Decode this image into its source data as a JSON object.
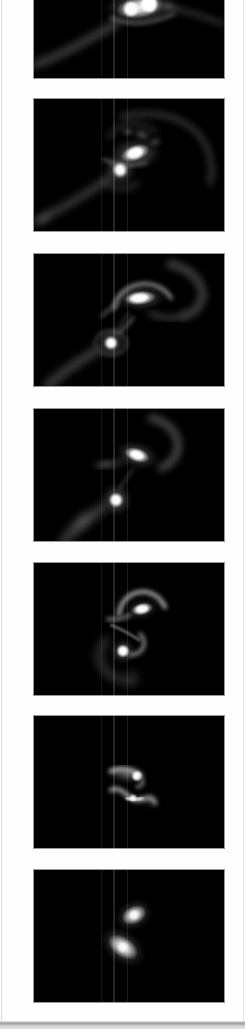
{
  "app": {
    "title": "Galaxy merger simulation filmstrip"
  },
  "colors": {
    "page_background": "#fefefe",
    "frame_background": "#000000",
    "frame_border": "#979797",
    "panel_left_border": "#dcdcdc",
    "bottom_edge": "#9e9e9e",
    "galaxy_core": "#ffffff",
    "tidal_tail": "#4a4a4a"
  },
  "frames": [
    {
      "id": "frame-1",
      "label": "Simulation frame 1 - bright merging core with long tidal tail (top cropped by scroll)"
    },
    {
      "id": "frame-2",
      "label": "Simulation frame 2 - two cores, sweeping right arc and lower-left tidal tail"
    },
    {
      "id": "frame-3",
      "label": "Simulation frame 3 - spiral core under dome arc, companion core with broad tail"
    },
    {
      "id": "frame-4",
      "label": "Simulation frame 4 - cores linked by bridge, broad tidal fan lower-left"
    },
    {
      "id": "frame-5",
      "label": "Simulation frame 5 - S-shaped hooked arcs between two cores"
    },
    {
      "id": "frame-6",
      "label": "Simulation frame 6 - two compact comma-shaped remnants"
    },
    {
      "id": "frame-7",
      "label": "Simulation frame 7 - two smooth elliptical remnants"
    }
  ]
}
